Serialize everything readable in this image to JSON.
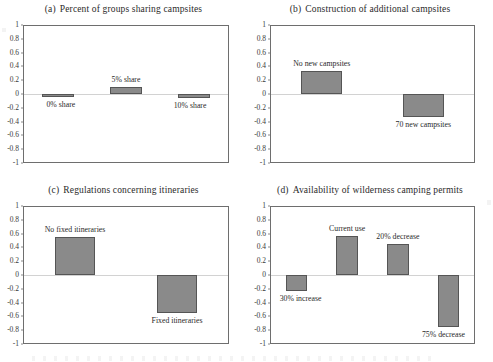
{
  "figure": {
    "panel_count": 4
  },
  "axis": {
    "tick_labels": [
      "1",
      "0.8",
      "0.6",
      "0.4",
      "0.2",
      "0",
      "-0.2",
      "-0.4",
      "-0.6",
      "-0.8",
      "-1"
    ],
    "tick_values": [
      1,
      0.8,
      0.6,
      0.4,
      0.2,
      0,
      -0.2,
      -0.4,
      -0.6,
      -0.8,
      -1
    ]
  },
  "colors": {
    "bar_fill": "#8a8a8a",
    "bar_border": "#555555",
    "frame": "#6e6e6e",
    "zero_line": "#d2d2d2",
    "text": "#2a2a2a",
    "background": "#ffffff"
  },
  "chart_data": [
    {
      "type": "bar",
      "panel": "a",
      "panel_tag": "(a)",
      "title": "Percent of groups sharing campsites",
      "xlabel": "",
      "ylabel": "",
      "ylim": [
        -1,
        1
      ],
      "grid": false,
      "legend": "none",
      "zero_reference_line": true,
      "categories": [
        "0% share",
        "5% share",
        "10% share"
      ],
      "values": [
        -0.04,
        0.11,
        -0.06
      ],
      "label_positions": [
        "below",
        "above",
        "below"
      ]
    },
    {
      "type": "bar",
      "panel": "b",
      "panel_tag": "(b)",
      "title": "Construction of additional campsites",
      "xlabel": "",
      "ylabel": "",
      "ylim": [
        -1,
        1
      ],
      "grid": false,
      "legend": "none",
      "zero_reference_line": true,
      "categories": [
        "No new campsites",
        "70 new campsites"
      ],
      "values": [
        0.34,
        -0.34
      ],
      "label_positions": [
        "above",
        "below"
      ]
    },
    {
      "type": "bar",
      "panel": "c",
      "panel_tag": "(c)",
      "title": "Regulations concerning itineraries",
      "xlabel": "",
      "ylabel": "",
      "ylim": [
        -1,
        1
      ],
      "grid": false,
      "legend": "none",
      "zero_reference_line": true,
      "categories": [
        "No fixed itineraries",
        "Fixed itineraries"
      ],
      "values": [
        0.56,
        -0.56
      ],
      "label_positions": [
        "above",
        "below"
      ]
    },
    {
      "type": "bar",
      "panel": "d",
      "panel_tag": "(d)",
      "title": "Availability of wilderness camping permits",
      "xlabel": "",
      "ylabel": "",
      "ylim": [
        -1,
        1
      ],
      "grid": false,
      "legend": "none",
      "zero_reference_line": true,
      "categories": [
        "30% increase",
        "Current use",
        "20% decrease",
        "75% decrease"
      ],
      "values": [
        -0.23,
        0.58,
        0.45,
        -0.77
      ],
      "label_positions": [
        "below",
        "above",
        "above",
        "below"
      ]
    }
  ]
}
